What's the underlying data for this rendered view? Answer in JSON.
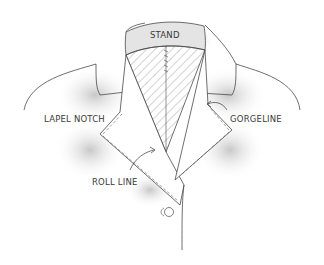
{
  "diagram": {
    "labels": {
      "stand": "STAND",
      "lapel_notch": "LAPEL NOTCH",
      "gorgeline": "GORGELINE",
      "roll_line": "ROLL LINE"
    },
    "colors": {
      "line": "#4a4a4a",
      "shading": "#8a8a8a",
      "text": "#3a3a3a",
      "background": "#ffffff"
    }
  }
}
